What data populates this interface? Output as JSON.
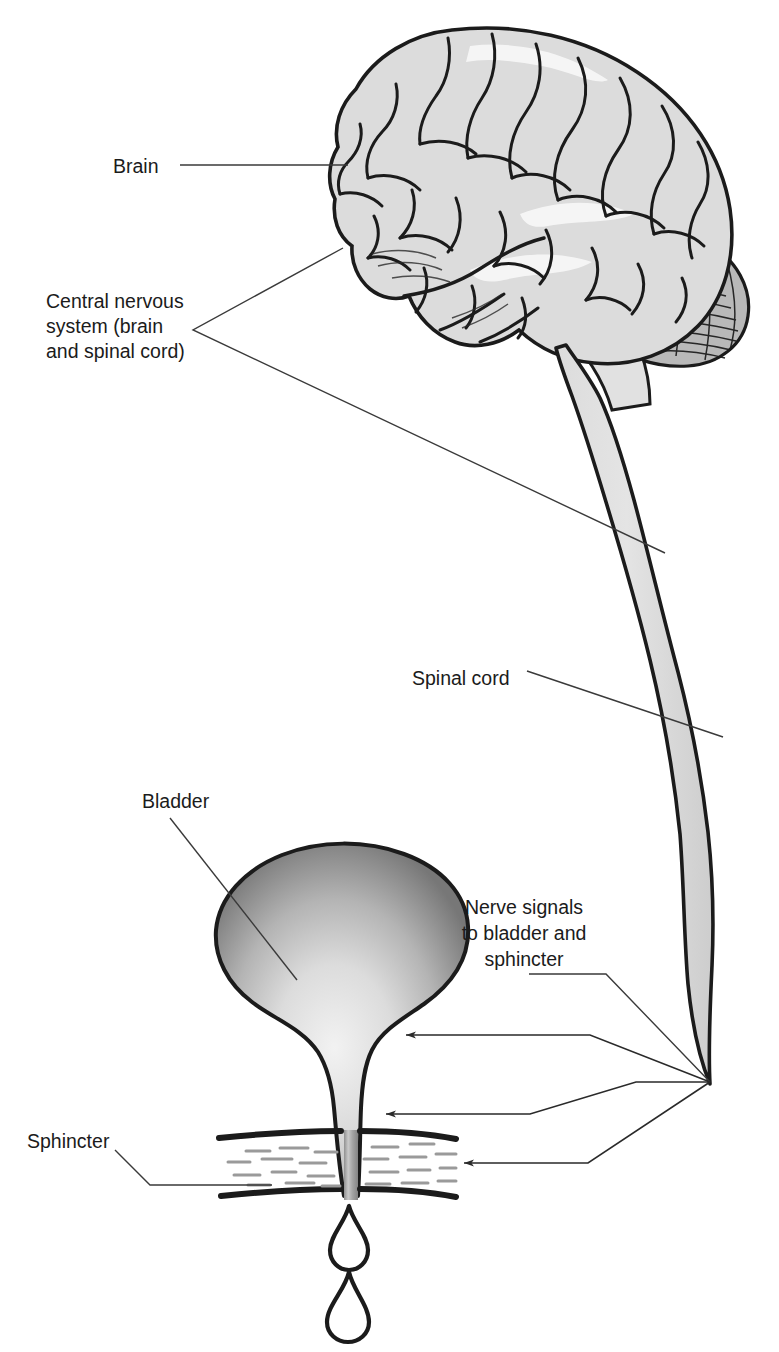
{
  "figure": {
    "type": "anatomical-diagram",
    "background_color": "#ffffff",
    "line_color": "#1b1b1b",
    "leader_line_color": "#3a3a3a",
    "organ_fill_light": "#d8d8d8",
    "organ_fill_mid": "#a8a8a8",
    "organ_fill_dark": "#6e6e6e"
  },
  "labels": {
    "brain": {
      "text": "Brain",
      "x": 113,
      "y": 173
    },
    "cns": {
      "lines": [
        "Central nervous",
        "system (brain",
        "and spinal cord)"
      ],
      "x": 46,
      "y": 308
    },
    "spinal_cord": {
      "text": "Spinal cord",
      "x": 412,
      "y": 685
    },
    "bladder": {
      "text": "Bladder",
      "x": 142,
      "y": 808
    },
    "nerve_signals": {
      "lines": [
        "Nerve signals",
        "to bladder and",
        "sphincter"
      ],
      "x": 524,
      "y": 914
    },
    "sphincter": {
      "text": "Sphincter",
      "x": 27,
      "y": 1148
    }
  },
  "structures": [
    {
      "name": "brain",
      "label": "Brain"
    },
    {
      "name": "cerebellum",
      "label": "Cerebellum"
    },
    {
      "name": "brainstem",
      "label": "Brainstem"
    },
    {
      "name": "spinal-cord",
      "label": "Spinal cord"
    },
    {
      "name": "bladder",
      "label": "Bladder"
    },
    {
      "name": "urethra",
      "label": "Urethra"
    },
    {
      "name": "sphincter",
      "label": "Sphincter"
    },
    {
      "name": "urine-drop-upper",
      "label": "Urine drop"
    },
    {
      "name": "urine-drop-lower",
      "label": "Urine drop"
    }
  ],
  "arrows": [
    {
      "name": "arrow-to-bladder",
      "target": "bladder",
      "tip_x": 400,
      "tip_y": 1035
    },
    {
      "name": "arrow-to-urethra",
      "target": "urethra",
      "tip_x": 380,
      "tip_y": 1114
    },
    {
      "name": "arrow-to-sphincter",
      "target": "sphincter",
      "tip_x": 458,
      "tip_y": 1163
    }
  ]
}
